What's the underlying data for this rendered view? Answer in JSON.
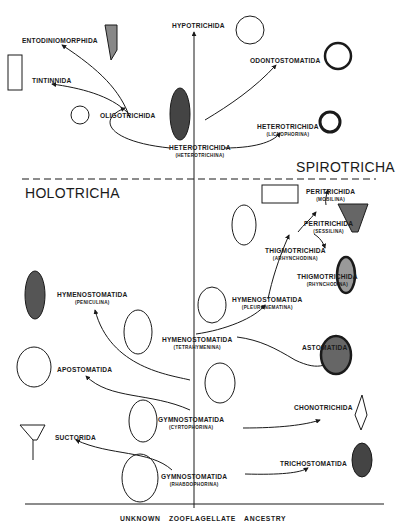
{
  "diagram": {
    "root": "UNKNOWN  ZOOFLAGELLATE  ANCESTRY",
    "groups": {
      "upper": "SPIROTRICHA",
      "lower": "HOLOTRICHA"
    },
    "nodes": {
      "hypotrichida": "HYPOTRICHIDA",
      "entodiniomorphida": "ENTODINIOMORPHIDA",
      "tintinnida": "TINTINNIDA",
      "oligotrichida": "OLIGOTRICHIDA",
      "odontostomatida": "ODONTOSTOMATIDA",
      "heterotrichida_licno": {
        "name": "HETEROTRICHIDA",
        "sub": "(LICNOPHORINA)"
      },
      "heterotrichida_hetero": {
        "name": "HETEROTRICHIDA",
        "sub": "(HETEROTRICHINA)"
      },
      "peritrichida_mob": {
        "name": "PERITRICHIDA",
        "sub": "(MOBILINA)"
      },
      "peritrichida_ses": {
        "name": "PERITRICHIDA",
        "sub": "(SESSILINA)"
      },
      "thigmo_arhyn": {
        "name": "THIGMOTRICHIDA",
        "sub": "(ARHYNCHODINA)"
      },
      "thigmo_rhyn": {
        "name": "THIGMOTRICHIDA",
        "sub": "(RHYNCHODINA)"
      },
      "hymeno_pleuro": {
        "name": "HYMENOSTOMATIDA",
        "sub": "(PLEURONEMATINA)"
      },
      "hymeno_penic": {
        "name": "HYMENOSTOMATIDA",
        "sub": "(PENICULINA)"
      },
      "hymeno_tetra": {
        "name": "HYMENOSTOMATIDA",
        "sub": "(TETRAHYMENINA)"
      },
      "astomatida": "ASTOMATIDA",
      "apostomatida": "APOSTOMATIDA",
      "gymno_cyrto": {
        "name": "GYMNOSTOMATIDA",
        "sub": "(CYRTOPHORINA)"
      },
      "chonotrichida": "CHONOTRICHIDA",
      "suctorida": "SUCTORIDA",
      "gymno_rhabdo": {
        "name": "GYMNOSTOMATIDA",
        "sub": "(RHABDOPHORINA)"
      },
      "trichostomatida": "TRICHOSTOMATIDA"
    },
    "colors": {
      "ink": "#1a1a1a",
      "background": "#ffffff"
    }
  }
}
